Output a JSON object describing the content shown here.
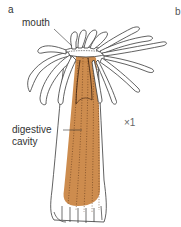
{
  "figure": {
    "panel_letters": [
      "a",
      "b"
    ],
    "labels": {
      "mouth": "mouth",
      "digestive_cavity_line1": "digestive",
      "digestive_cavity_line2": "cavity"
    },
    "scale": "×1",
    "colors": {
      "digestive_cavity_fill": "#c9823f",
      "outline": "#3a3a3a",
      "background": "#ffffff"
    }
  }
}
